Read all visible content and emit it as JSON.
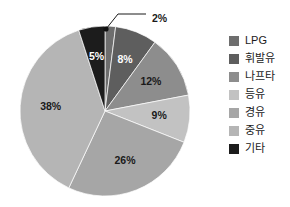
{
  "chart_data": {
    "type": "pie",
    "title": "",
    "subtitle": "",
    "xlabel": "",
    "ylabel": "",
    "grid": false,
    "legend_position": "right",
    "units": "%",
    "start_angle_deg": 0,
    "direction": "clockwise",
    "categories": [
      "LPG",
      "휘발유",
      "나프타",
      "등유",
      "경유",
      "중유",
      "기타"
    ],
    "values": [
      2,
      8,
      12,
      9,
      26,
      38,
      5
    ],
    "labels": [
      "2%",
      "8%",
      "12%",
      "9%",
      "26%",
      "38%",
      "5%"
    ],
    "colors": [
      "#6e6e6e",
      "#5e5e5e",
      "#8d8d8d",
      "#c2c2c2",
      "#a6a6a6",
      "#b5b5b5",
      "#1c1c1c"
    ],
    "slices": [
      {
        "name": "LPG",
        "value": 2,
        "label": "2%",
        "color": "#6e6e6e",
        "label_color": "#1a1a1a",
        "label_placement": "callout"
      },
      {
        "name": "휘발유",
        "value": 8,
        "label": "8%",
        "color": "#5e5e5e",
        "label_color": "#ffffff",
        "label_placement": "inside"
      },
      {
        "name": "나프타",
        "value": 12,
        "label": "12%",
        "color": "#8d8d8d",
        "label_color": "#1a1a1a",
        "label_placement": "inside"
      },
      {
        "name": "등유",
        "value": 9,
        "label": "9%",
        "color": "#c2c2c2",
        "label_color": "#1a1a1a",
        "label_placement": "inside"
      },
      {
        "name": "경유",
        "value": 26,
        "label": "26%",
        "color": "#a6a6a6",
        "label_color": "#1a1a1a",
        "label_placement": "inside"
      },
      {
        "name": "중유",
        "value": 38,
        "label": "38%",
        "color": "#b5b5b5",
        "label_color": "#1a1a1a",
        "label_placement": "inside"
      },
      {
        "name": "기타",
        "value": 5,
        "label": "5%",
        "color": "#1c1c1c",
        "label_color": "#ffffff",
        "label_placement": "inside"
      }
    ]
  },
  "pie": {
    "center_x": 105,
    "center_y": 111,
    "radius": 85,
    "callout": {
      "label": "2%",
      "label_x": 152,
      "label_y": 19,
      "dot_x": 106,
      "dot_y": 29,
      "elbow_x": 118,
      "elbow_y": 14,
      "end_x": 146,
      "end_y": 14
    }
  },
  "legend": {
    "items": [
      {
        "label": "LPG",
        "color": "#6e6e6e"
      },
      {
        "label": "휘발유",
        "color": "#5e5e5e"
      },
      {
        "label": "나프타",
        "color": "#8d8d8d"
      },
      {
        "label": "등유",
        "color": "#c2c2c2"
      },
      {
        "label": "경유",
        "color": "#a6a6a6"
      },
      {
        "label": "중유",
        "color": "#b5b5b5"
      },
      {
        "label": "기타",
        "color": "#1c1c1c"
      }
    ]
  },
  "theme": {
    "background": "#ffffff",
    "text_color": "#1a1a1a",
    "slice_border": "#ffffff"
  }
}
